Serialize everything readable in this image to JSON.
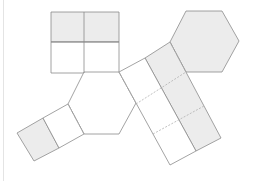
{
  "diagram": {
    "title": "",
    "colors": {
      "stroke": "#8c8c8c",
      "dashed_stroke": "#b0b0b0",
      "shade": "#ececec",
      "background": "#ffffff"
    },
    "shapes": [
      {
        "name": "top-square-shaded-top",
        "type": "polygon",
        "points": "51,12 119,12 119,42 51,42",
        "shaded": true
      },
      {
        "name": "top-square-bottom",
        "type": "polygon",
        "points": "51,42 119,42 119,73 51,73",
        "shaded": false
      },
      {
        "name": "upper-right-hexagon",
        "type": "polygon",
        "points": "186,11 222,11 239,41 222,72 186,72 170,42",
        "shaded": true
      },
      {
        "name": "central-hexagon",
        "type": "polygon",
        "points": "84,72 119,72 136,103 119,134 84,134 68,104",
        "shaded": false
      },
      {
        "name": "strip-right-column",
        "type": "polygon",
        "points": "145,58 170,42 221,138 196,151",
        "shaded": true
      },
      {
        "name": "strip-left-column",
        "type": "polygon",
        "points": "119,72 145,58 196,151 170,165",
        "shaded": false
      },
      {
        "name": "left-strip-outer-cell",
        "type": "polygon",
        "points": "17,133 43,118 59,148 34,161",
        "shaded": true
      },
      {
        "name": "left-strip-inner-cell",
        "type": "polygon",
        "points": "43,118 68,104 84,134 59,148",
        "shaded": false
      }
    ],
    "solid_lines": [
      "84,12 84,73",
      "51,42 119,42"
    ],
    "dashed_lines": [
      "119,72 136,103",
      "136,104 186,72",
      "153,134 204,106",
      "170,42 186,72",
      "68,104 84,134"
    ]
  }
}
